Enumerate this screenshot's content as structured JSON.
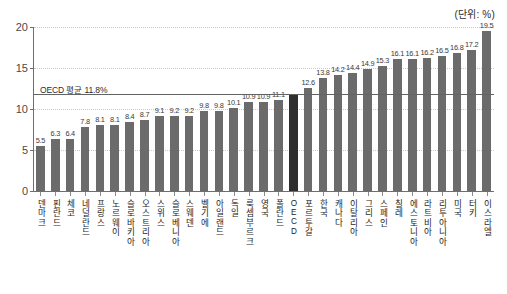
{
  "unit_caption": "(단위: %)",
  "average_label": "OECD 평균 11.8%",
  "yaxis": {
    "ticks": [
      "0",
      "5",
      "10",
      "15",
      "20"
    ],
    "min": 0,
    "max": 20
  },
  "chart_data": {
    "type": "bar",
    "title": "",
    "subtitle": "",
    "xlabel": "",
    "ylabel": "",
    "unit": "%",
    "ylim": [
      0,
      20
    ],
    "yticks": [
      0,
      5,
      10,
      15,
      20
    ],
    "grid": true,
    "legend": "none",
    "reference_line": {
      "label": "OECD 평균 11.8%",
      "value": 11.8
    },
    "categories": [
      "덴마크",
      "핀란드",
      "체코",
      "네덜란드",
      "프랑스",
      "노르웨이",
      "슬로바키아",
      "오스트리아",
      "스위스",
      "슬로베니아",
      "스웨덴",
      "벨기에",
      "아일랜드",
      "독일",
      "룩셈부르크",
      "영국",
      "폴란드",
      "OECD",
      "포르투갈",
      "한국",
      "캐나다",
      "이탈리아",
      "그리스",
      "스페인",
      "칠레",
      "에스토니아",
      "라트비아",
      "리투아니아",
      "미국",
      "터키",
      "이스라엘"
    ],
    "values": [
      5.5,
      6.3,
      6.4,
      7.8,
      8.1,
      8.1,
      8.4,
      8.7,
      9.1,
      9.2,
      9.2,
      9.8,
      9.8,
      10.1,
      10.9,
      10.9,
      11.1,
      11.8,
      12.6,
      13.8,
      14.2,
      14.4,
      14.9,
      15.3,
      16.1,
      16.1,
      16.2,
      16.5,
      16.8,
      17.2,
      19.5
    ],
    "value_labels": [
      "5.5",
      "6.3",
      "6.4",
      "7.8",
      "8.1",
      "8.1",
      "8.4",
      "8.7",
      "9.1",
      "9.2",
      "9.2",
      "9.8",
      "9.8",
      "10.1",
      "10.9",
      "10.9",
      "11.1",
      "",
      "12.6",
      "13.8",
      "14.2",
      "14.4",
      "14.9",
      "15.3",
      "16.1",
      "16.1",
      "16.2",
      "16.5",
      "16.8",
      "17.2",
      "19.5"
    ],
    "highlight_index": 17,
    "bar_color": "#6b6b6b",
    "highlight_color": "#2e2e2e"
  }
}
